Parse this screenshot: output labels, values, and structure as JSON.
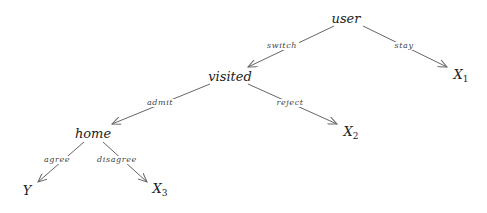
{
  "diagram": {
    "type": "decision-tree",
    "colors": {
      "edge": "#666666",
      "text": "#222222",
      "background": "#ffffff"
    },
    "nodes": [
      {
        "id": "user",
        "label": "user",
        "sub": "",
        "x": 346,
        "y": 18
      },
      {
        "id": "visited",
        "label": "visited",
        "sub": "",
        "x": 230,
        "y": 76
      },
      {
        "id": "x1",
        "label": "X",
        "sub": "1",
        "x": 461,
        "y": 76
      },
      {
        "id": "home",
        "label": "home",
        "sub": "",
        "x": 93,
        "y": 133
      },
      {
        "id": "x2",
        "label": "X",
        "sub": "2",
        "x": 351,
        "y": 133
      },
      {
        "id": "y",
        "label": "Y",
        "sub": "",
        "x": 27,
        "y": 190
      },
      {
        "id": "x3",
        "label": "X",
        "sub": "3",
        "x": 160,
        "y": 190
      }
    ],
    "edges": [
      {
        "from": "user",
        "to": "visited",
        "label": "switch",
        "x1": 334,
        "y1": 26,
        "x2": 248,
        "y2": 67,
        "lx": 282,
        "ly": 46
      },
      {
        "from": "user",
        "to": "x1",
        "label": "stay",
        "x1": 363,
        "y1": 26,
        "x2": 447,
        "y2": 67,
        "lx": 404,
        "ly": 46
      },
      {
        "from": "visited",
        "to": "home",
        "label": "admit",
        "x1": 210,
        "y1": 84,
        "x2": 112,
        "y2": 124,
        "lx": 160,
        "ly": 103
      },
      {
        "from": "visited",
        "to": "x2",
        "label": "reject",
        "x1": 248,
        "y1": 84,
        "x2": 337,
        "y2": 124,
        "lx": 290,
        "ly": 103
      },
      {
        "from": "home",
        "to": "y",
        "label": "agree",
        "x1": 84,
        "y1": 142,
        "x2": 38,
        "y2": 182,
        "lx": 57,
        "ly": 160
      },
      {
        "from": "home",
        "to": "x3",
        "label": "disagree",
        "x1": 103,
        "y1": 142,
        "x2": 147,
        "y2": 182,
        "lx": 117,
        "ly": 160
      }
    ]
  }
}
